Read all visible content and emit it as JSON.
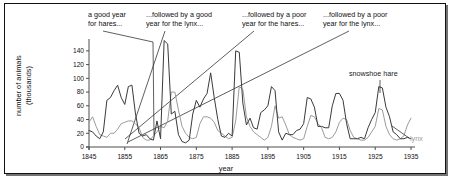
{
  "figure": {
    "frame_border_color": "#111111"
  },
  "chart_data": {
    "type": "line",
    "title": "",
    "xlabel": "year",
    "ylabel": "number of animals (thousands)",
    "ylabel_line1": "number of animals",
    "ylabel_line2": "(thousands)",
    "xlim": [
      1845,
      1935
    ],
    "ylim": [
      0,
      150
    ],
    "yticks": [
      0,
      20,
      40,
      60,
      80,
      100,
      120,
      140
    ],
    "ytick_labels": [
      "0",
      "20",
      "40",
      "60",
      "80",
      "100",
      "120",
      "140"
    ],
    "xticks": [
      1845,
      1855,
      1865,
      1875,
      1885,
      1895,
      1905,
      1915,
      1925,
      1935
    ],
    "xtick_labels": [
      "1845",
      "1855",
      "1865",
      "1875",
      "1885",
      "1895",
      "1905",
      "1915",
      "1925",
      "1935"
    ],
    "grid": false,
    "legend_position": "inline-annotations",
    "x": [
      1845,
      1846,
      1847,
      1848,
      1849,
      1850,
      1851,
      1852,
      1853,
      1854,
      1855,
      1856,
      1857,
      1858,
      1859,
      1860,
      1861,
      1862,
      1863,
      1864,
      1865,
      1866,
      1867,
      1868,
      1869,
      1870,
      1871,
      1872,
      1873,
      1874,
      1875,
      1876,
      1877,
      1878,
      1879,
      1880,
      1881,
      1882,
      1883,
      1884,
      1885,
      1886,
      1887,
      1888,
      1889,
      1890,
      1891,
      1892,
      1893,
      1894,
      1895,
      1896,
      1897,
      1898,
      1899,
      1900,
      1901,
      1902,
      1903,
      1904,
      1905,
      1906,
      1907,
      1908,
      1909,
      1910,
      1911,
      1912,
      1913,
      1914,
      1915,
      1916,
      1917,
      1918,
      1919,
      1920,
      1921,
      1922,
      1923,
      1924,
      1925,
      1926,
      1927,
      1928,
      1929,
      1930,
      1931,
      1932,
      1933,
      1934,
      1935
    ],
    "series": [
      {
        "name": "snowshoe hare",
        "color": "#3a3a3a",
        "values": [
          24,
          22,
          16,
          12,
          22,
          68,
          72,
          82,
          90,
          72,
          62,
          88,
          90,
          48,
          20,
          16,
          18,
          12,
          10,
          38,
          12,
          155,
          150,
          48,
          52,
          18,
          8,
          6,
          10,
          48,
          68,
          58,
          70,
          78,
          108,
          72,
          40,
          16,
          14,
          20,
          16,
          140,
          138,
          64,
          32,
          42,
          28,
          26,
          50,
          54,
          60,
          88,
          82,
          22,
          10,
          20,
          18,
          18,
          24,
          26,
          34,
          72,
          70,
          58,
          30,
          30,
          28,
          28,
          60,
          78,
          78,
          68,
          34,
          12,
          12,
          12,
          14,
          12,
          28,
          40,
          50,
          88,
          86,
          58,
          44,
          22,
          18,
          12,
          12,
          14,
          12
        ]
      },
      {
        "name": "lynx",
        "color": "#9b9b9b",
        "values": [
          36,
          44,
          30,
          18,
          16,
          14,
          20,
          20,
          26,
          34,
          36,
          38,
          38,
          34,
          28,
          14,
          10,
          10,
          16,
          22,
          30,
          28,
          38,
          80,
          80,
          54,
          30,
          20,
          14,
          12,
          14,
          34,
          44,
          44,
          42,
          36,
          24,
          20,
          16,
          12,
          14,
          38,
          88,
          84,
          44,
          30,
          22,
          18,
          14,
          10,
          14,
          30,
          60,
          42,
          44,
          32,
          18,
          14,
          12,
          10,
          12,
          30,
          46,
          44,
          34,
          28,
          14,
          12,
          14,
          22,
          36,
          42,
          40,
          24,
          14,
          12,
          10,
          10,
          14,
          22,
          30,
          56,
          54,
          30,
          18,
          12,
          10,
          12,
          16,
          32,
          42
        ]
      }
    ],
    "annotations": [
      {
        "id": "a1",
        "text_line1": "a good year",
        "text_line2": "for hares...",
        "points_to_year": 1864
      },
      {
        "id": "a2",
        "text_line1": "...followed by a good",
        "text_line2": "year for the lynx...",
        "points_to_year": 1868
      },
      {
        "id": "a3",
        "text_line1": "...followed by a poor",
        "text_line2": "year for the hares...",
        "points_to_year": 1867
      },
      {
        "id": "a4",
        "text_line1": "...followed by a poor",
        "text_line2": "year for the lynx...",
        "points_to_year": 1869
      }
    ],
    "series_labels": [
      {
        "id": "hare-label",
        "text": "snowshoe hare",
        "color": "#1a1a1a"
      },
      {
        "id": "lynx-label",
        "text": "lynx",
        "color": "#9b9b9b"
      }
    ]
  }
}
